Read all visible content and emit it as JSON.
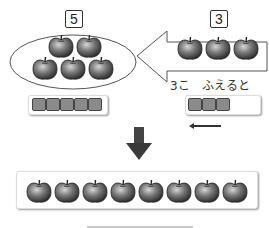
{
  "left_group": {
    "count_label": "5",
    "apple_count": 5,
    "tile_count": 5
  },
  "right_group": {
    "count_label": "3",
    "apple_count": 3,
    "tile_count": 3,
    "caption": "3こ　ふえると"
  },
  "result": {
    "apple_count": 8
  },
  "icons": {
    "down_arrow": "down-arrow",
    "left_arrow": "left-arrow"
  },
  "colors": {
    "apple_dark": "#2a2a2a",
    "apple_light": "#bdbdbd",
    "tile": "#8a8a8a",
    "outline": "#444444"
  }
}
